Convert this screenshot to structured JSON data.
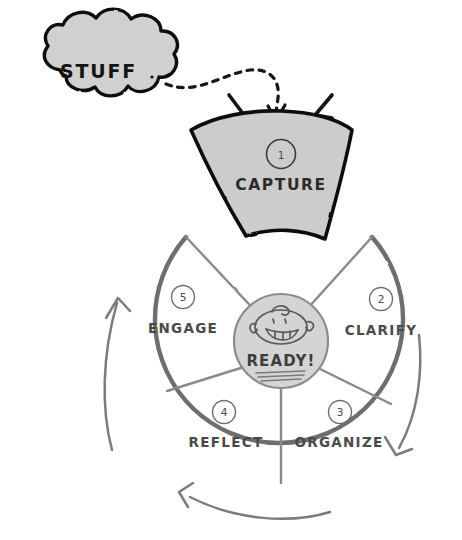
{
  "diagram": {
    "style": "hand-drawn sketch",
    "background_color": "#ffffff"
  },
  "cloud": {
    "label": "STUFF",
    "fill_color": "#d0d0d0",
    "stroke_color": "#111111",
    "icon": "cloud-shape"
  },
  "connector": {
    "icon": "dashed-curved-arrow",
    "stroke_color": "#111111",
    "style": "dashed",
    "from": "STUFF",
    "to": "CAPTURE"
  },
  "capture_wedge": {
    "number": "1",
    "label": "CAPTURE",
    "fill_color": "#cccccc",
    "stroke_color": "#111111",
    "detached": true,
    "pop_marks_icon": "pop-tick-marks"
  },
  "wheel": {
    "stroke_color": "#6e6e6e",
    "divider_color": "#8a8a8a",
    "segments": [
      {
        "number": "2",
        "label": "CLARIFY"
      },
      {
        "number": "3",
        "label": "ORGANIZE"
      },
      {
        "number": "4",
        "label": "REFLECT"
      },
      {
        "number": "5",
        "label": "ENGAGE"
      }
    ]
  },
  "hub": {
    "label": "READY!",
    "fill_color": "#d4d4d4",
    "stroke_color": "#8c8c8c",
    "face_icon": "smiling-face-icon"
  },
  "flow_arrows": [
    {
      "name": "arrow-right-descending",
      "icon": "curved-arrow-icon",
      "direction": "down-left"
    },
    {
      "name": "arrow-bottom-leftward",
      "icon": "curved-arrow-icon",
      "direction": "left"
    },
    {
      "name": "arrow-left-ascending",
      "icon": "curved-arrow-icon",
      "direction": "up"
    }
  ]
}
